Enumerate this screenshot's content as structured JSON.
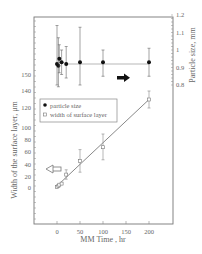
{
  "chart_data": {
    "type": "scatter",
    "title": "",
    "xlabel": "MM Time , hr",
    "ylabel_left": "Width of the surface layer, μm",
    "ylabel_right": "Particle size, mm",
    "x_ticks": [
      0,
      50,
      100,
      150,
      200
    ],
    "y_left_ticks": [
      0,
      20,
      40,
      60,
      80,
      100,
      120,
      140,
      150
    ],
    "y_right_ticks": [
      0.8,
      0.9,
      1,
      1.1,
      1.2
    ],
    "xlim": [
      -40,
      240
    ],
    "ylim_left": [
      -20,
      160
    ],
    "ylim_right": [
      0.8,
      1.2
    ],
    "legend": {
      "position": "left-middle",
      "entries": [
        "particle size",
        "width of surface layer"
      ]
    },
    "annotations": [
      "right arrow → particle size axis",
      "left arrow ← surface layer axis"
    ],
    "series": [
      {
        "name": "particle size",
        "axis": "right",
        "marker": "filled-circle",
        "x": [
          0,
          3,
          5,
          10,
          20,
          50,
          100,
          200
        ],
        "y": [
          0.92,
          0.91,
          0.95,
          0.93,
          0.92,
          0.93,
          0.93,
          0.93
        ],
        "err_low": [
          0.12,
          0.12,
          0.08,
          0.07,
          0.08,
          0.13,
          0.08,
          0.08
        ],
        "err_high": [
          0.22,
          0.16,
          0.08,
          0.07,
          0.1,
          0.2,
          0.07,
          0.08
        ]
      },
      {
        "name": "width of surface layer",
        "axis": "left",
        "marker": "open-square",
        "x": [
          0,
          3,
          5,
          10,
          20,
          50,
          100,
          200
        ],
        "y": [
          2,
          4,
          6,
          8,
          24,
          46,
          68,
          130
        ],
        "err_low": [
          1,
          1,
          1,
          1,
          8,
          18,
          20,
          10
        ],
        "err_high": [
          1,
          1,
          1,
          1,
          8,
          18,
          22,
          10
        ]
      }
    ],
    "fit_lines": [
      {
        "series": "width of surface layer",
        "x": [
          8,
          200
        ],
        "y": [
          10,
          130
        ]
      },
      {
        "series": "particle size",
        "x": [
          20,
          200
        ],
        "y": [
          0.92,
          0.92
        ]
      }
    ]
  }
}
